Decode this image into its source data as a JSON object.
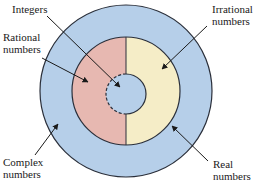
{
  "diagram": {
    "type": "nested-number-sets",
    "colors": {
      "complex": "#b6cfe9",
      "rational": "#e7b8b1",
      "irrational": "#f5edc7",
      "integers": "#b6cfe9",
      "stroke": "#2a2f3a"
    },
    "labels": {
      "integers": {
        "line1": "Integers"
      },
      "rational": {
        "line1": "Rational",
        "line2": "numbers"
      },
      "irrational": {
        "line1": "Irrational",
        "line2": "numbers"
      },
      "complex": {
        "line1": "Complex",
        "line2": "numbers"
      },
      "real": {
        "line1": "Real",
        "line2": "numbers"
      }
    }
  }
}
